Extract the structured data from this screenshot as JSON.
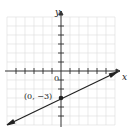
{
  "graph": {
    "x_axis_label": "x",
    "y_axis_label": "y",
    "origin_label": "0",
    "point_label": "(0, −3)",
    "point": {
      "x": 0,
      "y": -3
    },
    "line": {
      "slope": 0.5,
      "intercept": -3,
      "equation": "y = x/2 - 3"
    },
    "x_range": [
      -6,
      6
    ],
    "y_range": [
      -5,
      6
    ],
    "grid": true,
    "colors": {
      "line": "#222222",
      "grid": "#d8d8d8",
      "axis": "#333333"
    }
  }
}
